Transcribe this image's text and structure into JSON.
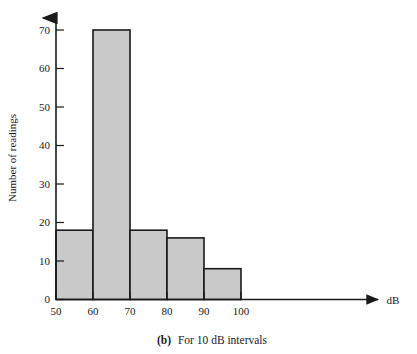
{
  "figure": {
    "caption_prefix": "(b)",
    "caption_text": "For 10 dB intervals"
  },
  "chart_data": {
    "type": "bar",
    "title": "",
    "subtitle": "",
    "xlabel": "dB",
    "ylabel": "Number of readings",
    "categories": [
      "50-60",
      "60-70",
      "70-80",
      "80-90",
      "90-100"
    ],
    "bin_edges": [
      50,
      60,
      70,
      80,
      90,
      100
    ],
    "values": [
      18,
      70,
      18,
      16,
      8
    ],
    "bar_fill": "#c9c9c9",
    "bar_stroke": "#1a1a1a",
    "xlim": [
      50,
      100
    ],
    "ylim": [
      0,
      70
    ],
    "xticks": [
      50,
      60,
      70,
      80,
      90,
      100
    ],
    "yticks": [
      0,
      10,
      20,
      30,
      40,
      50,
      60,
      70
    ],
    "xtick_labels": [
      "50",
      "60",
      "70",
      "80",
      "90",
      "100"
    ],
    "ytick_labels": [
      "0",
      "10",
      "20",
      "30",
      "40",
      "50",
      "60",
      "70"
    ],
    "grid": false,
    "legend": null,
    "axis_arrow_x": true,
    "axis_arrow_y": true
  }
}
